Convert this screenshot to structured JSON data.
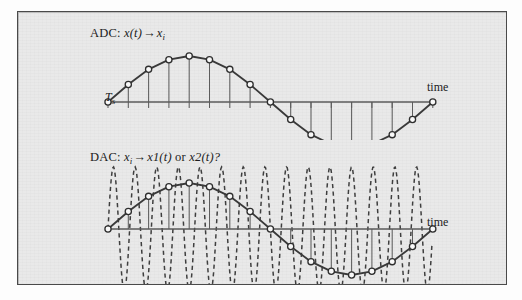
{
  "figure": {
    "background_color": "#e9e9e9",
    "frame_color": "#4a4a4a",
    "line_color": "#3a3a3a",
    "marker_fill": "#fafafa"
  },
  "panels": {
    "adc": {
      "label_prefix": "ADC: ",
      "label_input": "x",
      "label_input_paren": "(t)",
      "label_arrow": "→",
      "label_output": "x",
      "label_output_sub": "i",
      "axis_caption": "time",
      "period_label": "T",
      "period_sub": "s"
    },
    "dac": {
      "label_prefix": "DAC: ",
      "label_input": "x",
      "label_input_sub": "i",
      "label_arrow": "→",
      "label_out1": "x1",
      "label_out1_paren": "(t)",
      "label_conj": " or ",
      "label_out2": "x2",
      "label_out2_paren": "(t)?",
      "axis_caption": "time"
    }
  },
  "chart_data": [
    {
      "type": "line",
      "name": "adc-sampling",
      "title": "ADC: x(t) → x_i",
      "xlabel": "time",
      "ylabel": "",
      "grid": false,
      "legend": "none",
      "annotations": [
        "T_s"
      ],
      "axis_y_pixel": 90,
      "x_start_pixel": 90,
      "x_end_pixel": 415,
      "sample_interval_pixel": 20.3,
      "amplitude_pixel": 46,
      "series": [
        {
          "name": "x(t) sampled",
          "style": "solid-with-markers-and-stems",
          "sample_count": 17,
          "x": [
            0,
            1,
            2,
            3,
            4,
            5,
            6,
            7,
            8,
            9,
            10,
            11,
            12,
            13,
            14,
            15,
            16
          ],
          "values": [
            0.0,
            0.38,
            0.71,
            0.92,
            1.0,
            0.92,
            0.71,
            0.38,
            0.0,
            -0.38,
            -0.71,
            -0.92,
            -1.0,
            -0.92,
            -0.71,
            -0.38,
            0.0
          ]
        }
      ]
    },
    {
      "type": "line",
      "name": "dac-reconstruction",
      "title": "DAC: x_i → x1(t) or x2(t)?",
      "xlabel": "time",
      "ylabel": "",
      "grid": false,
      "legend": "none",
      "annotations": [],
      "axis_y_pixel": 89,
      "x_start_pixel": 90,
      "x_end_pixel": 415,
      "sample_interval_pixel": 20.3,
      "amplitude_pixel": 46,
      "series": [
        {
          "name": "x1(t)",
          "style": "solid-with-markers-and-stems",
          "sample_count": 17,
          "x": [
            0,
            1,
            2,
            3,
            4,
            5,
            6,
            7,
            8,
            9,
            10,
            11,
            12,
            13,
            14,
            15,
            16
          ],
          "values": [
            0.0,
            0.38,
            0.71,
            0.92,
            1.0,
            0.92,
            0.71,
            0.38,
            0.0,
            -0.38,
            -0.71,
            -0.92,
            -1.0,
            -0.92,
            -0.71,
            -0.38,
            0.0
          ]
        },
        {
          "name": "x2(t)",
          "style": "dashed-alias",
          "relative_frequency": 15,
          "amplitude_relative": 1.35,
          "description": "high-frequency alias passing through the same sample points"
        }
      ]
    }
  ]
}
